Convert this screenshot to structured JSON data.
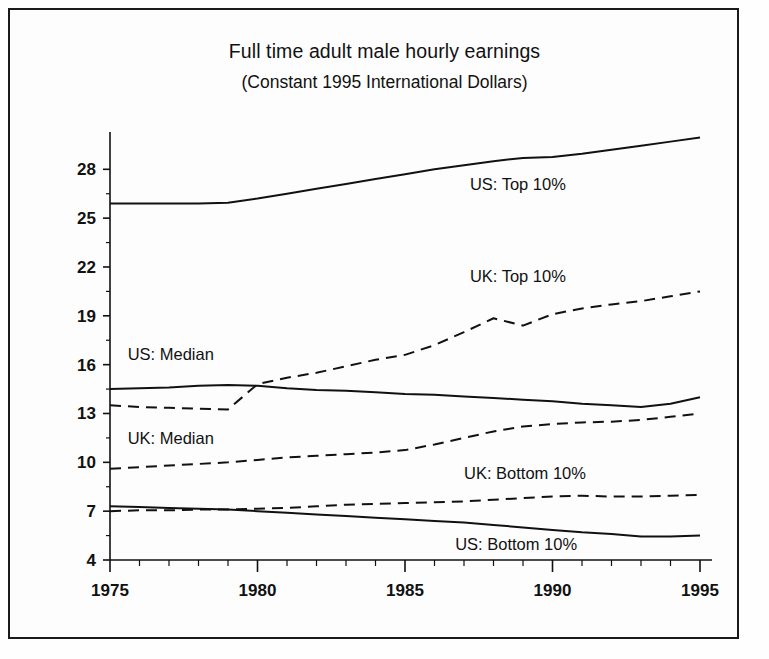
{
  "figure": {
    "title": "Full time adult male hourly earnings",
    "subtitle": "(Constant 1995 International Dollars)",
    "border_color": "#1a1a1a",
    "background": "#fdfdfd",
    "line_color": "#111111"
  },
  "axes": {
    "y_ticks": [
      "4",
      "7",
      "10",
      "13",
      "16",
      "19",
      "22",
      "25",
      "28"
    ],
    "x_ticks": [
      "1975",
      "1980",
      "1985",
      "1990",
      "1995"
    ]
  },
  "labels": {
    "us_top": "US: Top 10%",
    "uk_top": "UK: Top 10%",
    "us_median": "US: Median",
    "uk_median": "UK: Median",
    "uk_bottom": "UK: Bottom 10%",
    "us_bottom": "US: Bottom 10%"
  },
  "chart_data": {
    "type": "line",
    "title": "Full time adult male hourly earnings",
    "subtitle": "(Constant 1995 International Dollars)",
    "xlabel": "",
    "ylabel": "",
    "xlim": [
      1975,
      1995
    ],
    "ylim": [
      4,
      29.8
    ],
    "grid": false,
    "legend": "inline-annotations",
    "y_tick_values": [
      4,
      7,
      10,
      13,
      16,
      19,
      22,
      25,
      28
    ],
    "x_tick_values": [
      1975,
      1980,
      1985,
      1990,
      1995
    ],
    "x_minor_tick_step": 1,
    "x": [
      1975,
      1976,
      1977,
      1978,
      1979,
      1980,
      1981,
      1982,
      1983,
      1984,
      1985,
      1986,
      1987,
      1988,
      1989,
      1990,
      1991,
      1992,
      1993,
      1994,
      1995
    ],
    "series": [
      {
        "name": "US: Top 10%",
        "style": "solid",
        "values": [
          25.9,
          25.9,
          25.9,
          25.9,
          25.95,
          26.2,
          26.5,
          26.8,
          27.1,
          27.4,
          27.7,
          28.0,
          28.25,
          28.5,
          28.7,
          28.75,
          28.95,
          29.2,
          29.45,
          29.7,
          29.95
        ]
      },
      {
        "name": "UK: Top 10%",
        "style": "dashed",
        "values": [
          13.5,
          13.4,
          13.35,
          13.3,
          13.25,
          14.8,
          15.2,
          15.5,
          15.9,
          16.3,
          16.6,
          17.2,
          18.0,
          18.85,
          18.4,
          19.1,
          19.45,
          19.7,
          19.9,
          20.2,
          20.5
        ]
      },
      {
        "name": "US: Median",
        "style": "solid",
        "values": [
          14.5,
          14.55,
          14.6,
          14.7,
          14.75,
          14.7,
          14.55,
          14.45,
          14.4,
          14.3,
          14.2,
          14.15,
          14.05,
          13.95,
          13.85,
          13.75,
          13.6,
          13.5,
          13.4,
          13.6,
          14.0
        ]
      },
      {
        "name": "UK: Median",
        "style": "dashed",
        "values": [
          9.6,
          9.7,
          9.8,
          9.9,
          10.0,
          10.15,
          10.3,
          10.4,
          10.5,
          10.6,
          10.75,
          11.1,
          11.5,
          11.9,
          12.2,
          12.35,
          12.45,
          12.5,
          12.6,
          12.8,
          13.0
        ]
      },
      {
        "name": "UK: Bottom 10%",
        "style": "dashed",
        "values": [
          7.0,
          7.05,
          7.05,
          7.1,
          7.1,
          7.15,
          7.2,
          7.3,
          7.4,
          7.45,
          7.5,
          7.55,
          7.6,
          7.7,
          7.8,
          7.9,
          7.95,
          7.9,
          7.9,
          7.95,
          8.0
        ]
      },
      {
        "name": "US: Bottom 10%",
        "style": "solid",
        "values": [
          7.3,
          7.25,
          7.2,
          7.15,
          7.1,
          7.0,
          6.9,
          6.8,
          6.7,
          6.6,
          6.5,
          6.4,
          6.3,
          6.15,
          6.0,
          5.85,
          5.7,
          5.6,
          5.45,
          5.45,
          5.5
        ]
      }
    ],
    "annotations": [
      {
        "text": "US: Top 10%",
        "x": 1987.2,
        "y": 26.7
      },
      {
        "text": "UK: Top 10%",
        "x": 1987.2,
        "y": 21.1
      },
      {
        "text": "US: Median",
        "x": 1975.6,
        "y": 16.3
      },
      {
        "text": "UK: Median",
        "x": 1975.6,
        "y": 11.1
      },
      {
        "text": "UK: Bottom 10%",
        "x": 1987.0,
        "y": 9.0
      },
      {
        "text": "US: Bottom 10%",
        "x": 1986.7,
        "y": 4.6
      }
    ]
  }
}
